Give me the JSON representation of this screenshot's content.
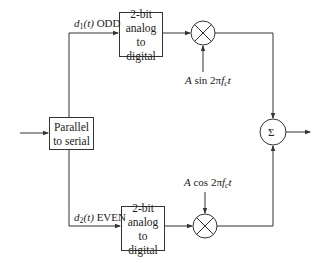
{
  "diagram": {
    "type": "block-diagram",
    "blocks": {
      "parallel_to_serial": {
        "line1": "Parallel",
        "line2": "to serial"
      },
      "adc_top": {
        "line1": "2-bit",
        "line2": "analog to",
        "line3": "digital"
      },
      "adc_bottom": {
        "line1": "2-bit",
        "line2": "analog to",
        "line3": "digital"
      },
      "multiplier_top": {
        "symbol": "×"
      },
      "multiplier_bottom": {
        "symbol": "×"
      },
      "summer": {
        "symbol": "Σ"
      }
    },
    "labels": {
      "odd_branch": {
        "var": "d",
        "sub": "1",
        "arg": "(t)",
        "text": "ODD"
      },
      "even_branch": {
        "var": "d",
        "sub": "2",
        "arg": "(t)",
        "text": "EVEN"
      },
      "carrier_sin": {
        "amp": "A",
        "fn": "sin 2π",
        "f": "f",
        "sub": "c",
        "t": "t"
      },
      "carrier_cos": {
        "amp": "A",
        "fn": "cos 2π",
        "f": "f",
        "sub": "c",
        "t": "t"
      }
    }
  }
}
